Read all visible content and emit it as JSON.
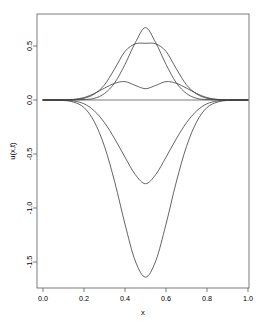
{
  "figure": {
    "background_color": "#ffffff",
    "frame_color": "#5a5a5a",
    "curve_color": "#3c3c3c"
  },
  "axes": {
    "x_title": "x",
    "y_title": "u(x,t)",
    "x_ticks": [
      "0.0",
      "0.2",
      "0.4",
      "0.6",
      "0.8",
      "1.0"
    ],
    "y_ticks": [
      "0.5",
      "0.0",
      "-0.5",
      "-1.0",
      "-1.5"
    ]
  },
  "chart_data": {
    "type": "line",
    "title": "",
    "xlabel": "x",
    "ylabel": "u(x,t)",
    "xlim": [
      0.0,
      1.0
    ],
    "ylim": [
      -1.69,
      0.8
    ],
    "grid": false,
    "legend": "none",
    "x_tick_values": [
      0.0,
      0.2,
      0.4,
      0.6,
      0.8,
      1.0
    ],
    "y_tick_values": [
      0.5,
      0.0,
      -0.5,
      -1.0,
      -1.5
    ],
    "x": [
      0.0,
      0.05,
      0.1,
      0.15,
      0.2,
      0.25,
      0.3,
      0.35,
      0.4,
      0.45,
      0.5,
      0.55,
      0.6,
      0.65,
      0.7,
      0.75,
      0.8,
      0.85,
      0.9,
      0.95,
      1.0
    ],
    "series": [
      {
        "name": "t0-initial-flat",
        "values": [
          0.0,
          0.0,
          0.0,
          0.0,
          0.0,
          0.0,
          0.0,
          0.0,
          0.0,
          0.0,
          0.0,
          0.0,
          0.0,
          0.0,
          0.0,
          0.0,
          0.0,
          0.0,
          0.0,
          0.0,
          0.0
        ]
      },
      {
        "name": "positive-sharp-peak",
        "values": [
          0.0,
          0.0,
          0.0,
          0.001,
          0.004,
          0.015,
          0.06,
          0.16,
          0.33,
          0.53,
          0.67,
          0.53,
          0.33,
          0.16,
          0.06,
          0.015,
          0.004,
          0.001,
          0.0,
          0.0,
          0.0
        ]
      },
      {
        "name": "positive-broad-peak",
        "values": [
          0.0,
          0.0,
          0.001,
          0.004,
          0.016,
          0.055,
          0.14,
          0.29,
          0.45,
          0.52,
          0.525,
          0.52,
          0.45,
          0.29,
          0.14,
          0.055,
          0.016,
          0.004,
          0.001,
          0.0,
          0.0
        ]
      },
      {
        "name": "positive-wavy-low",
        "values": [
          0.0,
          0.0,
          0.001,
          0.006,
          0.022,
          0.06,
          0.11,
          0.155,
          0.17,
          0.135,
          0.105,
          0.135,
          0.17,
          0.155,
          0.11,
          0.06,
          0.022,
          0.006,
          0.001,
          0.0,
          0.0
        ]
      },
      {
        "name": "negative-shallow-trough",
        "values": [
          0.0,
          0.0,
          -0.002,
          -0.01,
          -0.035,
          -0.1,
          -0.21,
          -0.36,
          -0.53,
          -0.69,
          -0.775,
          -0.69,
          -0.53,
          -0.36,
          -0.21,
          -0.1,
          -0.035,
          -0.01,
          -0.002,
          0.0,
          0.0
        ]
      },
      {
        "name": "negative-deep-trough",
        "values": [
          0.0,
          -0.001,
          -0.004,
          -0.02,
          -0.07,
          -0.2,
          -0.43,
          -0.76,
          -1.15,
          -1.49,
          -1.64,
          -1.49,
          -1.15,
          -0.76,
          -0.43,
          -0.2,
          -0.07,
          -0.02,
          -0.004,
          -0.001,
          0.0
        ]
      }
    ]
  }
}
